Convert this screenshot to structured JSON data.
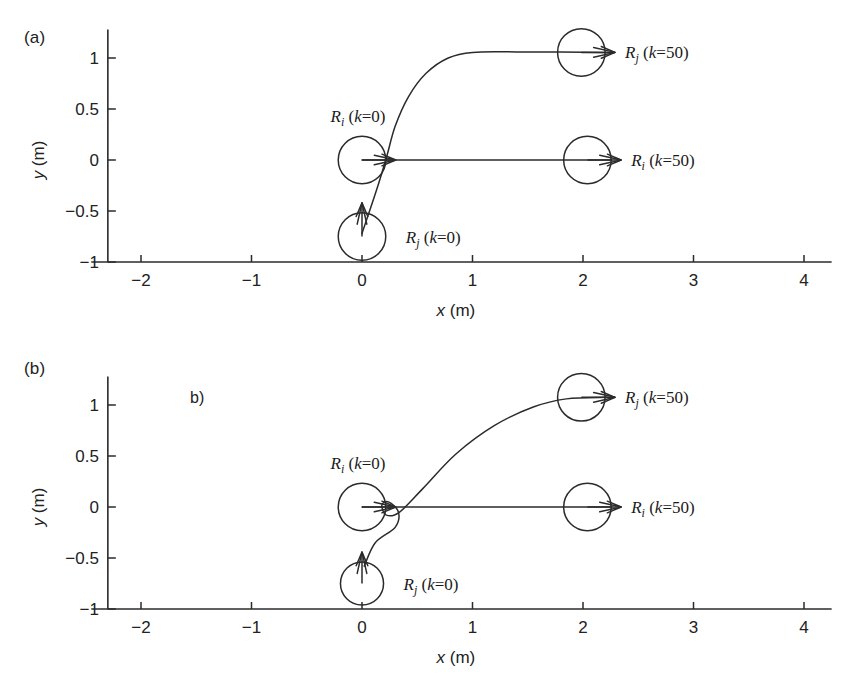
{
  "figure": {
    "type": "trajectory-plot-pair",
    "background": "#ffffff",
    "ink_color": "#2b2b2b"
  },
  "panels": [
    {
      "id": "a",
      "label": "(a)",
      "stray_note": "",
      "axes": {
        "xlabel": "x (m)",
        "ylabel": "y (m)",
        "xticks": [
          "-2",
          "-1",
          "0",
          "1",
          "2",
          "3",
          "4"
        ],
        "xtick_values": [
          -2,
          -1,
          0,
          1,
          2,
          3,
          4
        ],
        "yticks": [
          "1",
          "0.5",
          "0",
          "-0.5",
          "-1"
        ],
        "ytick_values": [
          1,
          0.5,
          0,
          -0.5,
          -1
        ],
        "xlim": [
          -2.45,
          4.25
        ],
        "ylim": [
          -1,
          1.28
        ],
        "grid": false
      },
      "robots": [
        {
          "name": "Ri-start",
          "label": "R_i (k=0)",
          "label_text": "Ri (k=0)",
          "sub": "i",
          "k": 0,
          "x": 0.0,
          "y": 0.0,
          "radius_m": 0.215,
          "heading_deg": 0,
          "label_pos": "above"
        },
        {
          "name": "Rj-start",
          "label": "R_j (k=0)",
          "label_text": "Rj (k=0)",
          "sub": "j",
          "k": 0,
          "x": 0.0,
          "y": -0.75,
          "radius_m": 0.215,
          "heading_deg": 90,
          "label_pos": "right"
        },
        {
          "name": "Rj-end",
          "label": "R_j (k=50)",
          "label_text": "Rj (k=50)",
          "sub": "j",
          "k": 50,
          "x": 1.985,
          "y": 1.055,
          "radius_m": 0.215,
          "heading_deg": 0,
          "label_pos": "right"
        },
        {
          "name": "Ri-end",
          "label": "R_i (k=50)",
          "label_text": "Ri (k=50)",
          "sub": "i",
          "k": 50,
          "x": 2.04,
          "y": 0.0,
          "radius_m": 0.215,
          "heading_deg": 0,
          "label_pos": "right"
        }
      ],
      "trajectories": [
        {
          "name": "Ri-straight-path",
          "from": "Ri (k=0)",
          "to": "Ri (k=50)",
          "style": "straight",
          "points": [
            [
              0.0,
              0.0
            ],
            [
              2.26,
              0.0
            ]
          ]
        },
        {
          "name": "Rj-avoidance-path",
          "from": "Rj (k=0)",
          "to": "Rj (k=50)",
          "style": "sharp-turn",
          "points": [
            [
              0.0,
              -0.72
            ],
            [
              0.13,
              -0.3
            ],
            [
              0.22,
              0.02
            ],
            [
              0.3,
              0.33
            ],
            [
              0.42,
              0.62
            ],
            [
              0.58,
              0.85
            ],
            [
              0.78,
              1.0
            ],
            [
              1.0,
              1.055
            ],
            [
              1.4,
              1.06
            ],
            [
              2.23,
              1.055
            ]
          ]
        }
      ]
    },
    {
      "id": "b",
      "label": "(b)",
      "stray_note": "b)",
      "axes": {
        "xlabel": "x (m)",
        "ylabel": "y (m)",
        "xticks": [
          "-2",
          "-1",
          "0",
          "1",
          "2",
          "3",
          "4"
        ],
        "xtick_values": [
          -2,
          -1,
          0,
          1,
          2,
          3,
          4
        ],
        "yticks": [
          "1",
          "0.5",
          "0",
          "-0.5",
          "-1"
        ],
        "ytick_values": [
          1,
          0.5,
          0,
          -0.5,
          -1
        ],
        "xlim": [
          -2.45,
          4.25
        ],
        "ylim": [
          -1,
          1.28
        ],
        "grid": false
      },
      "robots": [
        {
          "name": "Ri-start",
          "label": "R_i (k=0)",
          "label_text": "Ri (k=0)",
          "sub": "i",
          "k": 0,
          "x": 0.0,
          "y": 0.0,
          "radius_m": 0.215,
          "heading_deg": 0,
          "label_pos": "above"
        },
        {
          "name": "Rj-start",
          "label": "R_j (k=0)",
          "label_text": "Rj (k=0)",
          "sub": "j",
          "k": 0,
          "x": 0.0,
          "y": -0.75,
          "radius_m": 0.195,
          "heading_deg": 90,
          "label_pos": "right"
        },
        {
          "name": "Rj-end",
          "label": "R_j (k=50)",
          "label_text": "Rj (k=50)",
          "sub": "j",
          "k": 50,
          "x": 1.985,
          "y": 1.075,
          "radius_m": 0.215,
          "heading_deg": 0,
          "label_pos": "right"
        },
        {
          "name": "Ri-end",
          "label": "R_i (k=50)",
          "label_text": "Ri (k=50)",
          "sub": "i",
          "k": 50,
          "x": 2.04,
          "y": 0.0,
          "radius_m": 0.215,
          "heading_deg": 0,
          "label_pos": "right"
        }
      ],
      "trajectories": [
        {
          "name": "Ri-straight-path",
          "from": "Ri (k=0)",
          "to": "Ri (k=50)",
          "style": "straight",
          "points": [
            [
              0.0,
              0.0
            ],
            [
              2.26,
              0.0
            ]
          ]
        },
        {
          "name": "Rj-avoidance-path",
          "from": "Rj (k=0)",
          "to": "Rj (k=50)",
          "style": "smooth-arc",
          "points": [
            [
              0.02,
              -0.58
            ],
            [
              0.12,
              -0.35
            ],
            [
              0.3,
              -0.2
            ],
            [
              0.33,
              -0.05
            ],
            [
              0.24,
              0.05
            ],
            [
              0.18,
              0.02
            ],
            [
              0.22,
              -0.08
            ],
            [
              0.34,
              -0.05
            ],
            [
              0.55,
              0.18
            ],
            [
              0.85,
              0.52
            ],
            [
              1.2,
              0.8
            ],
            [
              1.55,
              0.98
            ],
            [
              1.85,
              1.06
            ],
            [
              2.22,
              1.075
            ]
          ]
        }
      ]
    }
  ],
  "chart_data": {
    "type": "line",
    "title": "",
    "xlabel": "x (m)",
    "ylabel": "y (m)",
    "xlim": [
      -2.45,
      4.25
    ],
    "ylim": [
      -1,
      1.28
    ],
    "grid": false,
    "legend": "none",
    "subplots": [
      {
        "panel": "a",
        "annotations": [
          "(a)",
          "Ri (k=0)",
          "Rj (k=0)",
          "Ri (k=50)",
          "Rj (k=50)"
        ],
        "series": [
          {
            "name": "Ri path (straight)",
            "x": [
              0.0,
              2.26
            ],
            "y": [
              0.0,
              0.0
            ]
          },
          {
            "name": "Rj path (sharp turn)",
            "x": [
              0.0,
              0.13,
              0.22,
              0.3,
              0.42,
              0.58,
              0.78,
              1.0,
              1.4,
              2.23
            ],
            "y": [
              -0.72,
              -0.3,
              0.02,
              0.33,
              0.62,
              0.85,
              1.0,
              1.055,
              1.06,
              1.055
            ]
          }
        ],
        "markers": [
          {
            "label": "Ri (k=0)",
            "x": 0.0,
            "y": 0.0,
            "r": 0.215
          },
          {
            "label": "Rj (k=0)",
            "x": 0.0,
            "y": -0.75,
            "r": 0.215
          },
          {
            "label": "Ri (k=50)",
            "x": 2.04,
            "y": 0.0,
            "r": 0.215
          },
          {
            "label": "Rj (k=50)",
            "x": 1.985,
            "y": 1.055,
            "r": 0.215
          }
        ]
      },
      {
        "panel": "b",
        "annotations": [
          "(b)",
          "b)",
          "Ri (k=0)",
          "Rj (k=0)",
          "Ri (k=50)",
          "Rj (k=50)"
        ],
        "series": [
          {
            "name": "Ri path (straight)",
            "x": [
              0.0,
              2.26
            ],
            "y": [
              0.0,
              0.0
            ]
          },
          {
            "name": "Rj path (smooth arc with kink)",
            "x": [
              0.02,
              0.12,
              0.3,
              0.33,
              0.24,
              0.18,
              0.22,
              0.34,
              0.55,
              0.85,
              1.2,
              1.55,
              1.85,
              2.22
            ],
            "y": [
              -0.58,
              -0.35,
              -0.2,
              -0.05,
              0.05,
              0.02,
              -0.08,
              -0.05,
              0.18,
              0.52,
              0.8,
              0.98,
              1.06,
              1.075
            ]
          }
        ],
        "markers": [
          {
            "label": "Ri (k=0)",
            "x": 0.0,
            "y": 0.0,
            "r": 0.215
          },
          {
            "label": "Rj (k=0)",
            "x": 0.0,
            "y": -0.75,
            "r": 0.195
          },
          {
            "label": "Ri (k=50)",
            "x": 2.04,
            "y": 0.0,
            "r": 0.215
          },
          {
            "label": "Rj (k=50)",
            "x": 1.985,
            "y": 1.075,
            "r": 0.215
          }
        ]
      }
    ]
  }
}
